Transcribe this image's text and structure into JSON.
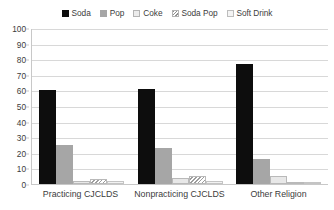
{
  "chart_data": {
    "type": "bar",
    "title": "",
    "subtitle": "",
    "xlabel": "",
    "ylabel": "",
    "ylim": [
      0,
      100
    ],
    "ytick_step": 10,
    "yticks": [
      "100",
      "90",
      "80",
      "70",
      "60",
      "50",
      "40",
      "30",
      "20",
      "10",
      "0"
    ],
    "grid": true,
    "legend_position": "top-center",
    "categories": [
      "Practicing CJCLDS",
      "Nonpracticing CJCLDS",
      "Other Religion"
    ],
    "series": [
      {
        "name": "Soda",
        "color": "#0d0d0d",
        "values": [
          60,
          61,
          77
        ]
      },
      {
        "name": "Pop",
        "color": "#a6a6a6",
        "values": [
          25,
          23,
          16
        ]
      },
      {
        "name": "Coke",
        "color": "#e8e8e8",
        "values": [
          2,
          4,
          5
        ]
      },
      {
        "name": "Soda Pop",
        "color": "#9d9d9d",
        "values": [
          3,
          5,
          1
        ]
      },
      {
        "name": "Soft Drink",
        "color": "#f2f2f2",
        "values": [
          2,
          2,
          1
        ]
      }
    ]
  },
  "legend": {
    "items": [
      {
        "label": "Soda",
        "swatch": "legend-swatch-soda"
      },
      {
        "label": "Pop",
        "swatch": "legend-swatch-pop"
      },
      {
        "label": "Coke",
        "swatch": "legend-swatch-coke"
      },
      {
        "label": "Soda Pop",
        "swatch": "legend-swatch-soda-pop"
      },
      {
        "label": "Soft Drink",
        "swatch": "legend-swatch-soft-drink"
      }
    ]
  }
}
